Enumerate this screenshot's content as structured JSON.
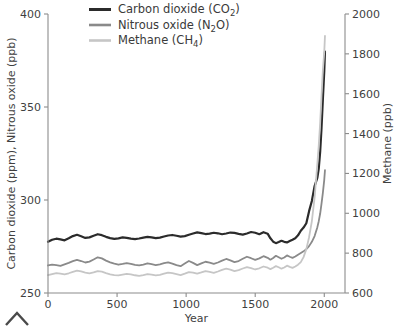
{
  "chart_data": {
    "type": "line",
    "title": "",
    "xlabel": "Year",
    "ylabel_left": "Carbon dioxide (ppm), Nitrous oxide (ppb)",
    "ylabel_right": "Methane (ppb)",
    "xlim": [
      0,
      2150
    ],
    "xticks": [
      0,
      500,
      1000,
      1500,
      2000
    ],
    "xtick_labels": [
      "0",
      "500",
      "1000",
      "1500",
      "2000"
    ],
    "ylim_left": [
      250,
      400
    ],
    "yticks_left": [
      250,
      300,
      350,
      400
    ],
    "ytick_labels_left": [
      "250",
      "300",
      "350",
      "400"
    ],
    "ylim_right": [
      600,
      2000
    ],
    "yticks_right": [
      600,
      800,
      1000,
      1200,
      1400,
      1600,
      1800,
      2000
    ],
    "ytick_labels_right": [
      "600",
      "800",
      "1000",
      "1200",
      "1400",
      "1600",
      "1800",
      "2000"
    ],
    "grid": false,
    "legend_position": "top-center",
    "colors": {
      "carbon_dioxide": "#2b2b2b",
      "nitrous_oxide": "#8a8a8a",
      "methane": "#c6c6c6",
      "axis": "#8c8c8c",
      "text": "#3a3a3a",
      "background": "#ffffff"
    },
    "series": [
      {
        "name": "Carbon dioxide (CO2)",
        "label_main": "Carbon dioxide (CO",
        "label_sub": "2",
        "label_tail": ")",
        "unit": "ppm",
        "axis": "left",
        "color": "#2b2b2b",
        "x": [
          0,
          30,
          60,
          90,
          120,
          150,
          180,
          210,
          240,
          270,
          300,
          330,
          360,
          390,
          420,
          450,
          480,
          510,
          540,
          570,
          600,
          630,
          660,
          690,
          720,
          750,
          780,
          810,
          840,
          870,
          900,
          930,
          960,
          990,
          1020,
          1050,
          1080,
          1110,
          1140,
          1170,
          1200,
          1230,
          1260,
          1290,
          1320,
          1350,
          1380,
          1410,
          1440,
          1470,
          1500,
          1530,
          1560,
          1590,
          1610,
          1630,
          1650,
          1670,
          1690,
          1710,
          1730,
          1750,
          1770,
          1790,
          1810,
          1830,
          1850,
          1870,
          1890,
          1910,
          1930,
          1950,
          1960,
          1970,
          1980,
          1990,
          2000,
          2005
        ],
        "values": [
          277.5,
          278.6,
          279.2,
          278.8,
          278.3,
          279.4,
          280.6,
          281.3,
          280.5,
          279.6,
          279.9,
          280.8,
          281.6,
          281.1,
          280.2,
          279.5,
          279.1,
          279.4,
          279.9,
          279.6,
          279.2,
          279.0,
          279.3,
          279.8,
          280.2,
          279.9,
          279.5,
          279.8,
          280.4,
          280.9,
          281.2,
          280.8,
          280.3,
          280.6,
          281.3,
          282.0,
          282.6,
          282.2,
          281.7,
          281.9,
          282.4,
          282.1,
          281.6,
          282.0,
          282.5,
          282.3,
          281.8,
          281.4,
          282.0,
          282.8,
          282.4,
          281.6,
          282.7,
          281.9,
          279.4,
          277.6,
          276.8,
          277.4,
          278.1,
          277.5,
          277.2,
          277.9,
          278.6,
          279.4,
          281.0,
          283.5,
          285.2,
          287.5,
          294.0,
          299.5,
          307.5,
          312.0,
          316.9,
          325.7,
          338.7,
          354.4,
          369.5,
          379.8
        ]
      },
      {
        "name": "Nitrous oxide (N2O)",
        "label_main": "Nitrous oxide (N",
        "label_sub": "2",
        "label_tail": "O)",
        "unit": "ppb",
        "axis": "left",
        "color": "#8a8a8a",
        "x": [
          0,
          30,
          60,
          90,
          120,
          150,
          180,
          210,
          240,
          270,
          300,
          330,
          360,
          390,
          420,
          450,
          480,
          510,
          540,
          570,
          600,
          630,
          660,
          690,
          720,
          750,
          780,
          810,
          840,
          870,
          900,
          930,
          960,
          990,
          1020,
          1050,
          1080,
          1110,
          1140,
          1170,
          1200,
          1230,
          1260,
          1290,
          1320,
          1350,
          1380,
          1410,
          1440,
          1470,
          1500,
          1530,
          1560,
          1590,
          1610,
          1630,
          1650,
          1670,
          1690,
          1710,
          1730,
          1750,
          1770,
          1790,
          1810,
          1830,
          1850,
          1870,
          1890,
          1910,
          1930,
          1950,
          1960,
          1970,
          1980,
          1990,
          2000,
          2005
        ],
        "values": [
          264.8,
          265.3,
          265.0,
          264.6,
          265.4,
          266.2,
          267.1,
          267.8,
          267.2,
          266.4,
          266.9,
          268.0,
          269.2,
          268.6,
          267.4,
          266.5,
          265.8,
          265.2,
          265.6,
          266.1,
          265.7,
          265.1,
          264.8,
          265.3,
          265.9,
          265.5,
          265.0,
          265.4,
          266.0,
          266.5,
          265.8,
          265.0,
          264.4,
          265.8,
          267.2,
          266.2,
          265.0,
          265.9,
          266.8,
          266.3,
          265.7,
          266.4,
          267.4,
          268.3,
          267.5,
          266.6,
          267.2,
          268.4,
          269.5,
          268.7,
          267.8,
          268.6,
          269.8,
          268.9,
          267.9,
          268.8,
          270.0,
          269.2,
          268.4,
          269.1,
          270.2,
          269.5,
          268.9,
          269.6,
          270.6,
          271.5,
          272.4,
          273.6,
          275.2,
          277.5,
          280.6,
          285.4,
          288.6,
          292.6,
          298.0,
          304.0,
          311.0,
          316.0
        ]
      },
      {
        "name": "Methane (CH4)",
        "label_main": "Methane (CH",
        "label_sub": "4",
        "label_tail": ")",
        "unit": "ppb",
        "axis": "right",
        "color": "#c6c6c6",
        "x": [
          0,
          30,
          60,
          90,
          120,
          150,
          180,
          210,
          240,
          270,
          300,
          330,
          360,
          390,
          420,
          450,
          480,
          510,
          540,
          570,
          600,
          630,
          660,
          690,
          720,
          750,
          780,
          810,
          840,
          870,
          900,
          930,
          960,
          990,
          1020,
          1050,
          1080,
          1110,
          1140,
          1170,
          1200,
          1230,
          1260,
          1290,
          1320,
          1350,
          1380,
          1410,
          1440,
          1470,
          1500,
          1530,
          1560,
          1590,
          1610,
          1630,
          1650,
          1670,
          1690,
          1710,
          1730,
          1750,
          1770,
          1790,
          1810,
          1830,
          1850,
          1870,
          1890,
          1910,
          1930,
          1950,
          1960,
          1970,
          1980,
          1990,
          2000,
          2005
        ],
        "values": [
          690,
          695,
          700,
          697,
          693,
          699,
          706,
          712,
          708,
          702,
          698,
          703,
          710,
          707,
          700,
          694,
          690,
          688,
          692,
          696,
          693,
          689,
          686,
          690,
          695,
          692,
          688,
          691,
          697,
          702,
          700,
          695,
          690,
          697,
          705,
          702,
          697,
          703,
          710,
          706,
          701,
          708,
          716,
          722,
          717,
          710,
          715,
          723,
          730,
          725,
          718,
          724,
          733,
          727,
          720,
          727,
          735,
          729,
          722,
          728,
          737,
          731,
          726,
          733,
          742,
          755,
          780,
          820,
          880,
          960,
          1080,
          1250,
          1340,
          1450,
          1590,
          1720,
          1810,
          1890
        ]
      }
    ]
  },
  "legend": {
    "items": [
      {
        "label": "Carbon dioxide (CO2)"
      },
      {
        "label": "Nitrous oxide (N2O)"
      },
      {
        "label": "Methane (CH4)"
      }
    ]
  },
  "axes": {
    "x_title": "Year",
    "y_left_title": "Carbon dioxide (ppm), Nitrous oxide (ppb)",
    "y_right_title": "Methane (ppb)"
  }
}
